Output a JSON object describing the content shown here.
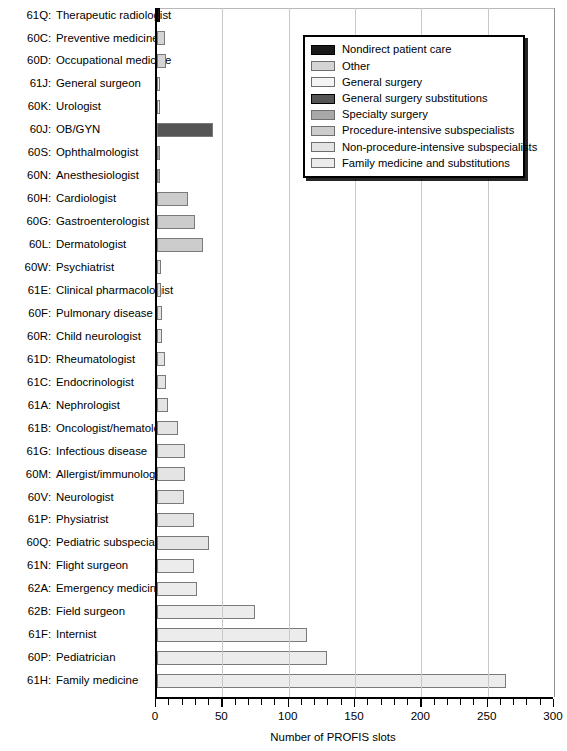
{
  "chart_data": {
    "type": "bar",
    "orientation": "horizontal",
    "title": "",
    "xlabel": "Number of PROFIS slots",
    "ylabel": "",
    "xlim": [
      0,
      300
    ],
    "xticks": [
      0,
      50,
      100,
      150,
      200,
      250,
      300
    ],
    "xticklabels": [
      "0",
      "50",
      "100",
      "150",
      "200",
      "250",
      "300"
    ],
    "minor_tick_interval": 10,
    "grid": "vertical",
    "legend_position": "upper right",
    "categories": [
      "61Q: Therapeutic radiologist",
      "60C: Preventive medicine",
      "60D: Occupational medicine",
      "61J: General surgeon",
      "60K: Urologist",
      "60J: OB/GYN",
      "60S: Ophthalmologist",
      "60N: Anesthesiologist",
      "60H: Cardiologist",
      "60G: Gastroenterologist",
      "60L: Dermatologist",
      "60W: Psychiatrist",
      "61E: Clinical pharmacologist",
      "60F: Pulmonary disease",
      "60R: Child neurologist",
      "61D: Rheumatologist",
      "61C: Endocrinologist",
      "61A: Nephrologist",
      "61B: Oncologist/hematologist",
      "61G: Infectious disease",
      "60M: Allergist/immunologist",
      "60V: Neurologist",
      "61P: Physiatrist",
      "60Q: Pediatric subspecialist",
      "61N: Flight surgeon",
      "62A: Emergency medicine",
      "62B: Field surgeon",
      "61F: Internist",
      "60P: Pediatrician",
      "61H: Family medicine"
    ],
    "values": [
      2,
      6,
      7,
      2,
      2,
      42,
      2,
      2,
      23,
      29,
      35,
      3,
      3,
      4,
      4,
      6,
      7,
      8,
      16,
      21,
      21,
      20,
      28,
      39,
      28,
      30,
      74,
      113,
      128,
      263
    ],
    "bars": [
      {
        "code": "61Q",
        "name": "Therapeutic radiologist",
        "value": 2,
        "group": "nondirect-patient-care"
      },
      {
        "code": "60C",
        "name": "Preventive medicine",
        "value": 6,
        "group": "other"
      },
      {
        "code": "60D",
        "name": "Occupational medicine",
        "value": 7,
        "group": "other"
      },
      {
        "code": "61J",
        "name": "General surgeon",
        "value": 2,
        "group": "general-surgery"
      },
      {
        "code": "60K",
        "name": "Urologist",
        "value": 2,
        "group": "general-surgery"
      },
      {
        "code": "60J",
        "name": "OB/GYN",
        "value": 42,
        "group": "general-surgery-substitutions"
      },
      {
        "code": "60S",
        "name": "Ophthalmologist",
        "value": 2,
        "group": "specialty-surgery"
      },
      {
        "code": "60N",
        "name": "Anesthesiologist",
        "value": 2,
        "group": "specialty-surgery"
      },
      {
        "code": "60H",
        "name": "Cardiologist",
        "value": 23,
        "group": "procedure-intensive-subspecialists"
      },
      {
        "code": "60G",
        "name": "Gastroenterologist",
        "value": 29,
        "group": "procedure-intensive-subspecialists"
      },
      {
        "code": "60L",
        "name": "Dermatologist",
        "value": 35,
        "group": "procedure-intensive-subspecialists"
      },
      {
        "code": "60W",
        "name": "Psychiatrist",
        "value": 3,
        "group": "non-procedure-intensive-subspecialists"
      },
      {
        "code": "61E",
        "name": "Clinical pharmacologist",
        "value": 3,
        "group": "non-procedure-intensive-subspecialists"
      },
      {
        "code": "60F",
        "name": "Pulmonary disease",
        "value": 4,
        "group": "non-procedure-intensive-subspecialists"
      },
      {
        "code": "60R",
        "name": "Child neurologist",
        "value": 4,
        "group": "non-procedure-intensive-subspecialists"
      },
      {
        "code": "61D",
        "name": "Rheumatologist",
        "value": 6,
        "group": "non-procedure-intensive-subspecialists"
      },
      {
        "code": "61C",
        "name": "Endocrinologist",
        "value": 7,
        "group": "non-procedure-intensive-subspecialists"
      },
      {
        "code": "61A",
        "name": "Nephrologist",
        "value": 8,
        "group": "non-procedure-intensive-subspecialists"
      },
      {
        "code": "61B",
        "name": "Oncologist/hematologist",
        "value": 16,
        "group": "non-procedure-intensive-subspecialists"
      },
      {
        "code": "61G",
        "name": "Infectious disease",
        "value": 21,
        "group": "non-procedure-intensive-subspecialists"
      },
      {
        "code": "60M",
        "name": "Allergist/immunologist",
        "value": 21,
        "group": "non-procedure-intensive-subspecialists"
      },
      {
        "code": "60V",
        "name": "Neurologist",
        "value": 20,
        "group": "non-procedure-intensive-subspecialists"
      },
      {
        "code": "61P",
        "name": "Physiatrist",
        "value": 28,
        "group": "non-procedure-intensive-subspecialists"
      },
      {
        "code": "60Q",
        "name": "Pediatric subspecialist",
        "value": 39,
        "group": "non-procedure-intensive-subspecialists"
      },
      {
        "code": "61N",
        "name": "Flight surgeon",
        "value": 28,
        "group": "family-medicine-and-substitutions"
      },
      {
        "code": "62A",
        "name": "Emergency medicine",
        "value": 30,
        "group": "family-medicine-and-substitutions"
      },
      {
        "code": "62B",
        "name": "Field surgeon",
        "value": 74,
        "group": "family-medicine-and-substitutions"
      },
      {
        "code": "61F",
        "name": "Internist",
        "value": 113,
        "group": "family-medicine-and-substitutions"
      },
      {
        "code": "60P",
        "name": "Pediatrician",
        "value": 128,
        "group": "family-medicine-and-substitutions"
      },
      {
        "code": "61H",
        "name": "Family medicine",
        "value": 263,
        "group": "family-medicine-and-substitutions"
      }
    ],
    "legend": [
      {
        "key": "nondirect-patient-care",
        "label": "Nondirect patient care",
        "color": "#1a1a1a"
      },
      {
        "key": "other",
        "label": "Other",
        "color": "#d4d4d4"
      },
      {
        "key": "general-surgery",
        "label": "General surgery",
        "color": "#f4f4f4"
      },
      {
        "key": "general-surgery-substitutions",
        "label": "General surgery substitutions",
        "color": "#555555"
      },
      {
        "key": "specialty-surgery",
        "label": "Specialty surgery",
        "color": "#a8a8a8"
      },
      {
        "key": "procedure-intensive-subspecialists",
        "label": "Procedure-intensive subspecialists",
        "color": "#cccccc"
      },
      {
        "key": "non-procedure-intensive-subspecialists",
        "label": "Non-procedure-intensive subspecialists",
        "color": "#e4e4e4"
      },
      {
        "key": "family-medicine-and-substitutions",
        "label": "Family medicine and substitutions",
        "color": "#ececec"
      }
    ]
  }
}
